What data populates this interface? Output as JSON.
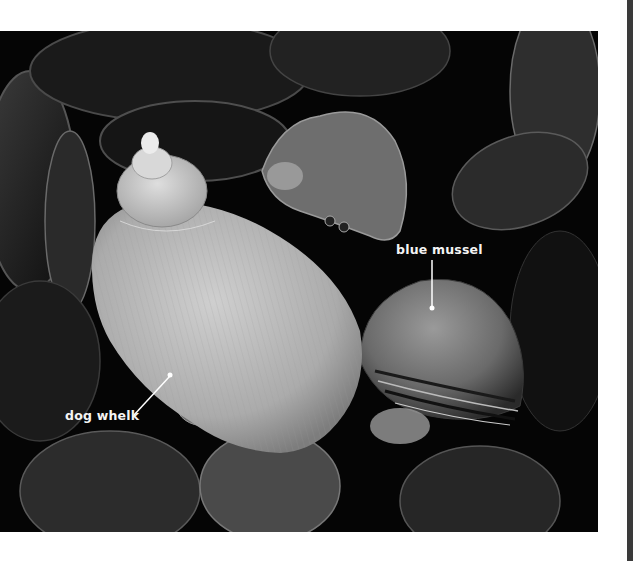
{
  "figure": {
    "labels": [
      {
        "text": "blue mussel",
        "target": "mussel-shell"
      },
      {
        "text": "dog whelk",
        "target": "whelk-shell"
      }
    ],
    "colors": {
      "background": "#050505",
      "whelk_shell": "#b9b9b9",
      "mussel_shell": "#8a8a8a",
      "label_text": "#f4f4f4",
      "page": "#ffffff"
    }
  }
}
